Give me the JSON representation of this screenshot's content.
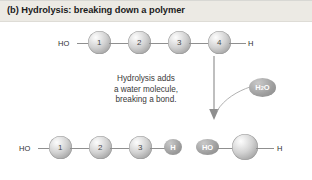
{
  "figure": {
    "label": "(b)",
    "title": "(b) Hydrolysis: breaking down a polymer"
  },
  "caption": {
    "line1": "Hydrolysis adds",
    "line2": "a water molecule,",
    "line3": "breaking a bond."
  },
  "top_chain": {
    "left_terminal": "HO",
    "right_terminal": "H",
    "monomers": [
      {
        "label": "1"
      },
      {
        "label": "2"
      },
      {
        "label": "3"
      },
      {
        "label": "4"
      }
    ]
  },
  "reactant": {
    "label_main": "H",
    "label_sub": "2",
    "label_tail": "O",
    "name": "water-molecule"
  },
  "bottom_left_fragment": {
    "left_terminal": "HO",
    "monomers": [
      {
        "label": "1"
      },
      {
        "label": "2"
      },
      {
        "label": "3"
      }
    ],
    "end_group": "H"
  },
  "bottom_right_fragment": {
    "start_group": "HO",
    "monomer": "",
    "right_terminal": "H"
  },
  "colors": {
    "title_band": "#eceae4",
    "title_text": "#1b1b1b",
    "sphere_mid": "#d2d2d2",
    "oval_fill": "#9c9c9c",
    "bond": "#8f8f8f",
    "arrow": "#7d7d7d",
    "caption_text": "#3a3a3a"
  }
}
